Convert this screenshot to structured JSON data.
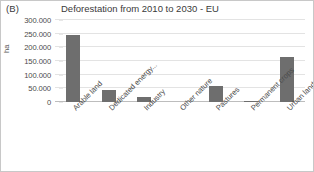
{
  "panel": {
    "label": "(B)"
  },
  "chart_data": {
    "type": "bar",
    "title": "Deforestation from 2010 to 2030 - EU",
    "xlabel": "",
    "ylabel": "ha",
    "categories": [
      "Arable land",
      "Dedicated energy...",
      "Industry",
      "Other nature",
      "Pastures",
      "Permanent crops",
      "Urban land"
    ],
    "values": [
      245000,
      45000,
      17000,
      0,
      58000,
      3000,
      163000
    ],
    "ylim": [
      0,
      300000
    ],
    "ytick_values": [
      0,
      50000,
      100000,
      150000,
      200000,
      250000,
      300000
    ],
    "ytick_labels": [
      "300.000",
      "250.000",
      "200.000",
      "150.000",
      "100.000",
      "50.000",
      "0"
    ],
    "grid": true,
    "legend": false,
    "bar_color": "#6e6e6e",
    "gridline_color": "#e3e3e3",
    "axis_color": "#bdbdbd",
    "background_color": "#ffffff"
  }
}
